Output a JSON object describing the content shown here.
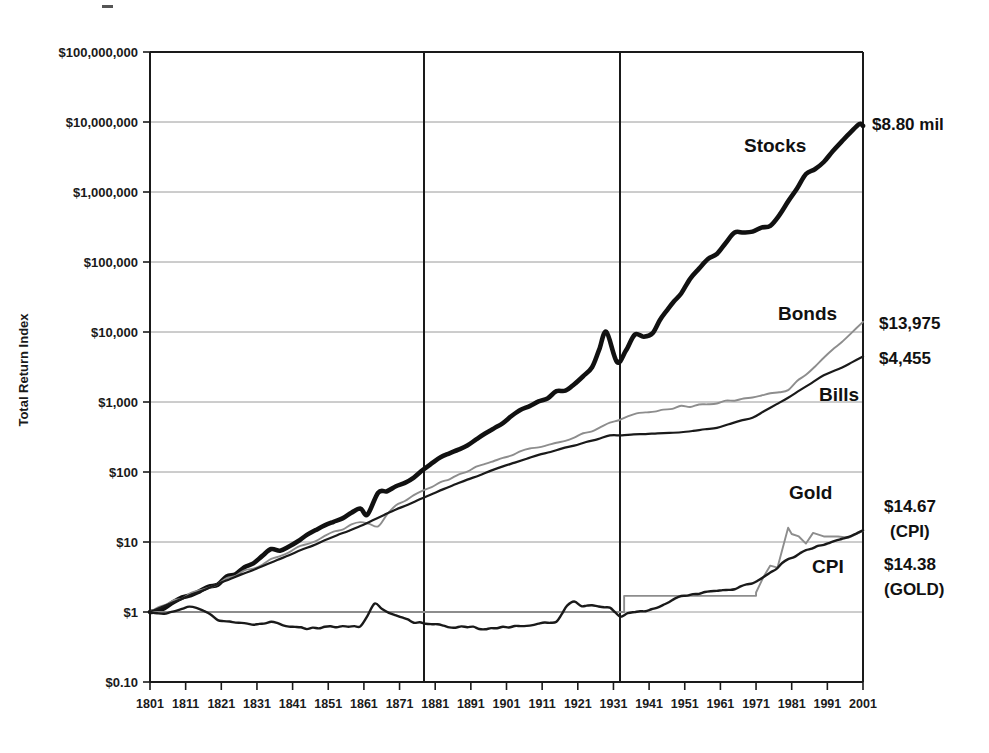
{
  "chart_data": {
    "type": "line",
    "title": "",
    "xlabel": "",
    "ylabel": "Total Return Index",
    "yscale": "log",
    "ylim": [
      0.1,
      100000000
    ],
    "xlim": [
      1801,
      2001
    ],
    "grid": true,
    "legend_position": "inline-annotations",
    "ytick_labels": [
      "$100,000,000",
      "$10,000,000",
      "$1,000,000",
      "$100,000",
      "$10,000",
      "$1,000",
      "$100",
      "$10",
      "$1",
      "$0.10"
    ],
    "ytick_values": [
      100000000,
      10000000,
      1000000,
      100000,
      10000,
      1000,
      100,
      10,
      1,
      0.1
    ],
    "xtick_labels": [
      "1801",
      "1811",
      "1821",
      "1831",
      "1841",
      "1851",
      "1861",
      "1871",
      "1881",
      "1891",
      "1901",
      "1911",
      "1921",
      "1931",
      "1941",
      "1951",
      "1961",
      "1971",
      "1981",
      "1991",
      "2001"
    ],
    "xtick_values": [
      1801,
      1811,
      1821,
      1831,
      1841,
      1851,
      1861,
      1871,
      1881,
      1891,
      1901,
      1911,
      1921,
      1931,
      1941,
      1951,
      1961,
      1971,
      1981,
      1991,
      2001
    ],
    "reference_lines": [
      {
        "name": "vline-1871",
        "x": 1871
      },
      {
        "name": "vline-1926",
        "x": 1926
      }
    ],
    "series": [
      {
        "name": "Stocks",
        "label": "Stocks",
        "end_label": "$8.80 mil",
        "end_value": 8800000,
        "color": "#111111",
        "x": [
          1801,
          1805,
          1810,
          1815,
          1820,
          1825,
          1830,
          1835,
          1840,
          1845,
          1850,
          1855,
          1860,
          1862,
          1865,
          1870,
          1875,
          1880,
          1885,
          1890,
          1895,
          1900,
          1905,
          1910,
          1915,
          1920,
          1925,
          1929,
          1932,
          1937,
          1942,
          1946,
          1950,
          1955,
          1960,
          1965,
          1970,
          1975,
          1980,
          1985,
          1990,
          1995,
          2000,
          2001
        ],
        "values": [
          1,
          1.2,
          1.6,
          1.9,
          2.6,
          3.6,
          4.7,
          7.6,
          8.2,
          13,
          18,
          23,
          30,
          26,
          52,
          61,
          82,
          132,
          185,
          250,
          360,
          520,
          800,
          1000,
          1350,
          1700,
          3300,
          10500,
          3800,
          8600,
          9500,
          20500,
          36000,
          85000,
          128000,
          250000,
          280000,
          330000,
          690000,
          1900000,
          2600000,
          5200000,
          9500000,
          8800000
        ]
      },
      {
        "name": "Bonds",
        "label": "Bonds",
        "end_label": "$13,975",
        "end_value": 13975,
        "color": "#8d8d8d",
        "x": [
          1801,
          1810,
          1820,
          1830,
          1840,
          1850,
          1860,
          1865,
          1870,
          1880,
          1890,
          1900,
          1910,
          1920,
          1930,
          1940,
          1950,
          1960,
          1970,
          1980,
          1990,
          1995,
          2001
        ],
        "values": [
          1,
          1.6,
          2.6,
          4.3,
          7.3,
          12,
          20,
          17,
          34,
          62,
          105,
          160,
          230,
          300,
          520,
          720,
          850,
          980,
          1150,
          1500,
          4200,
          7200,
          13975
        ]
      },
      {
        "name": "Bills",
        "label": "Bills",
        "end_label": "$4,455",
        "end_value": 4455,
        "color": "#1a1a1a",
        "x": [
          1801,
          1810,
          1820,
          1830,
          1840,
          1850,
          1860,
          1870,
          1880,
          1890,
          1900,
          1910,
          1920,
          1930,
          1940,
          1950,
          1960,
          1970,
          1980,
          1990,
          1995,
          2001
        ],
        "values": [
          1,
          1.55,
          2.5,
          4.0,
          6.5,
          10.5,
          17,
          29,
          48,
          78,
          120,
          175,
          240,
          330,
          350,
          370,
          430,
          600,
          1150,
          2400,
          3100,
          4455
        ]
      },
      {
        "name": "Gold",
        "label": "Gold",
        "end_label": "$14.38",
        "end_note": "(GOLD)",
        "end_value": 14.38,
        "color": "#8d8d8d",
        "x": [
          1801,
          1850,
          1900,
          1930,
          1933,
          1934,
          1940,
          1950,
          1960,
          1968,
          1971,
          1973,
          1975,
          1977,
          1980,
          1981,
          1983,
          1985,
          1987,
          1990,
          1994,
          1997,
          2001
        ],
        "values": [
          1,
          1,
          1,
          1,
          1,
          1.7,
          1.7,
          1.7,
          1.7,
          1.7,
          1.9,
          3.1,
          4.6,
          4.3,
          16,
          13,
          12,
          9.5,
          13.5,
          12,
          12,
          11.5,
          14.38
        ]
      },
      {
        "name": "CPI",
        "label": "CPI",
        "end_label": "$14.67",
        "end_note": "(CPI)",
        "end_value": 14.67,
        "color": "#1a1a1a",
        "x": [
          1801,
          1805,
          1812,
          1816,
          1820,
          1825,
          1830,
          1835,
          1840,
          1845,
          1850,
          1855,
          1860,
          1864,
          1866,
          1870,
          1875,
          1880,
          1885,
          1890,
          1895,
          1900,
          1905,
          1910,
          1915,
          1918,
          1920,
          1922,
          1925,
          1930,
          1933,
          1937,
          1940,
          1945,
          1950,
          1955,
          1960,
          1965,
          1970,
          1975,
          1980,
          1985,
          1990,
          1995,
          2001
        ],
        "values": [
          1,
          0.95,
          1.2,
          1.05,
          0.78,
          0.72,
          0.66,
          0.72,
          0.62,
          0.58,
          0.6,
          0.63,
          0.61,
          1.3,
          1.1,
          0.9,
          0.72,
          0.68,
          0.6,
          0.62,
          0.57,
          0.6,
          0.63,
          0.68,
          0.72,
          1.25,
          1.45,
          1.2,
          1.25,
          1.15,
          0.88,
          1.0,
          1.0,
          1.25,
          1.7,
          1.85,
          2.0,
          2.15,
          2.6,
          3.6,
          5.7,
          7.5,
          9.2,
          10.8,
          14.67
        ]
      }
    ]
  },
  "annotations": {
    "stocks_label": "Stocks",
    "bonds_label": "Bonds",
    "bills_label": "Bills",
    "gold_label": "Gold",
    "cpi_label": "CPI",
    "stocks_end": "$8.80 mil",
    "bonds_end": "$13,975",
    "bills_end": "$4,455",
    "cpi_end_value": "$14.67",
    "cpi_end_name": "(CPI)",
    "gold_end_value": "$14.38",
    "gold_end_name": "(GOLD)"
  },
  "axes": {
    "y_title": "Total Return Index"
  }
}
